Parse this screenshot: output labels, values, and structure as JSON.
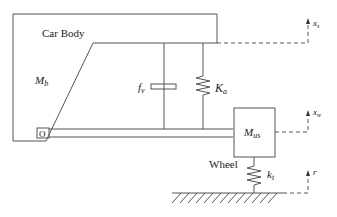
{
  "diagram": {
    "type": "quarter-car suspension schematic",
    "labels": {
      "car_body": "Car Body",
      "body_mass": "M",
      "body_mass_sub": "b",
      "damper": "f",
      "damper_sub": "v",
      "spring": "K",
      "spring_sub": "a",
      "unsprung_mass": "M",
      "unsprung_mass_sub": "us",
      "wheel": "Wheel",
      "tire_spring": "k",
      "tire_spring_sub": "t",
      "pivot": "O",
      "body_displacement": "x",
      "body_displacement_sub": "s",
      "wheel_displacement": "x",
      "wheel_displacement_sub": "w",
      "road_input": "r"
    },
    "colors": {
      "line": "#555555",
      "text": "#222222",
      "background": "#ffffff"
    }
  }
}
